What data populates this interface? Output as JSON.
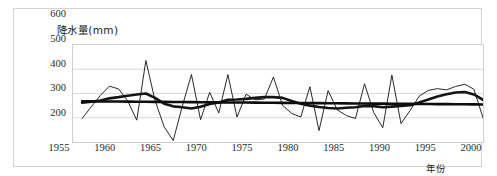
{
  "chart_data": {
    "type": "line",
    "title": "降水量(mm)",
    "ylabel": "降水量(mm)",
    "xlabel": "年份",
    "ylim": [
      200,
      600
    ],
    "xlim": [
      1955,
      2000
    ],
    "grid": true,
    "legend": "none",
    "y_ticks": [
      600,
      500,
      400,
      300,
      200
    ],
    "x_ticks": [
      1955,
      1960,
      1965,
      1970,
      1975,
      1980,
      1985,
      1990,
      1995,
      2000
    ],
    "x": [
      1956,
      1957,
      1958,
      1959,
      1960,
      1961,
      1962,
      1963,
      1964,
      1965,
      1966,
      1967,
      1968,
      1969,
      1970,
      1971,
      1972,
      1973,
      1974,
      1975,
      1976,
      1977,
      1978,
      1979,
      1980,
      1981,
      1982,
      1983,
      1984,
      1985,
      1986,
      1987,
      1988,
      1989,
      1990,
      1991,
      1992,
      1993,
      1994,
      1995,
      1996,
      1997,
      1998,
      1999,
      2000
    ],
    "series": [
      {
        "name": "年降水量",
        "style": "thin-annual",
        "color": "#111111",
        "values": [
          297,
          345,
          392,
          430,
          419,
          370,
          290,
          536,
          372,
          263,
          206,
          348,
          478,
          292,
          405,
          320,
          478,
          303,
          397,
          374,
          377,
          468,
          351,
          318,
          303,
          428,
          247,
          412,
          333,
          309,
          297,
          440,
          322,
          259,
          476,
          276,
          330,
          389,
          413,
          420,
          415,
          429,
          438,
          418,
          300
        ]
      },
      {
        "name": "5年滑动平均",
        "style": "thick-smoothed",
        "color": "#141414",
        "values": [
          362,
          366,
          371,
          380,
          385,
          391,
          396,
          400,
          382,
          358,
          347,
          343,
          338,
          345,
          357,
          363,
          374,
          375,
          378,
          382,
          385,
          385,
          382,
          369,
          358,
          350,
          344,
          340,
          338,
          341,
          343,
          349,
          348,
          343,
          346,
          349,
          352,
          363,
          375,
          388,
          397,
          404,
          406,
          396,
          374
        ]
      },
      {
        "name": "线性趋势线",
        "style": "trend-straight",
        "color": "#0d0d0d",
        "values": [
          368,
          367.7,
          367.4,
          367.1,
          366.8,
          366.5,
          366.2,
          365.9,
          365.6,
          365.3,
          365,
          364.7,
          364.4,
          364.1,
          363.8,
          363.5,
          363.2,
          362.9,
          362.6,
          362.3,
          362,
          361.7,
          361.4,
          361.1,
          360.8,
          360.5,
          360.2,
          359.9,
          359.6,
          359.3,
          359,
          358.7,
          358.4,
          358.1,
          357.8,
          357.5,
          357.2,
          356.9,
          356.6,
          356.3,
          356,
          355.7,
          355.4,
          355.1,
          354.8
        ]
      }
    ]
  }
}
